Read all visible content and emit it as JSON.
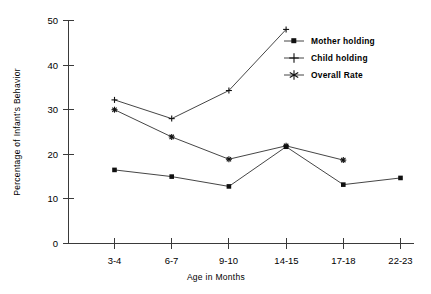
{
  "chart_data": {
    "type": "line",
    "title": "",
    "xlabel": "Age in Months",
    "ylabel": "Percentage of Infant's Behavior",
    "categories": [
      "3-4",
      "6-7",
      "9-10",
      "14-15",
      "17-18",
      "22-23"
    ],
    "ylim": [
      0,
      50
    ],
    "yticks": [
      0,
      10,
      20,
      30,
      40,
      50
    ],
    "ytick_labels": [
      "0",
      "10",
      "20",
      "30",
      "40",
      "50"
    ],
    "grid": false,
    "legend_position": "upper right",
    "series": [
      {
        "name": "Mother holding",
        "marker": "square",
        "values": [
          16.5,
          15.0,
          12.8,
          21.7,
          13.2,
          14.7
        ]
      },
      {
        "name": "Child holding",
        "marker": "plus",
        "values": [
          32.2,
          28.0,
          34.3,
          48.0,
          null,
          null
        ]
      },
      {
        "name": "Overall Rate",
        "marker": "asterisk",
        "values": [
          30.0,
          23.9,
          18.9,
          21.9,
          18.7,
          null
        ]
      }
    ]
  },
  "axes": {
    "y_label": "Percentage of Infant's Behavior",
    "x_label": "Age in Months",
    "y_tick_0": "0",
    "y_tick_1": "10",
    "y_tick_2": "20",
    "y_tick_3": "30",
    "y_tick_4": "40",
    "y_tick_5": "50",
    "x_tick_0": "3-4",
    "x_tick_1": "6-7",
    "x_tick_2": "9-10",
    "x_tick_3": "14-15",
    "x_tick_4": "17-18",
    "x_tick_5": "22-23"
  },
  "legend": {
    "item_0": "Mother holding",
    "item_1": "Child holding",
    "item_2": "Overall Rate"
  },
  "colors": {
    "ink": "#101010",
    "axis": "#3a3a3a",
    "background": "#ffffff"
  }
}
